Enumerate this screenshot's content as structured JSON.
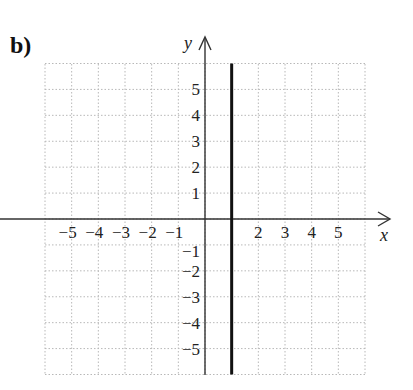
{
  "panel_label": "b)",
  "chart_data": {
    "type": "line",
    "title": "",
    "xlabel": "x",
    "ylabel": "y",
    "xlim": [
      -6,
      6
    ],
    "ylim": [
      -6,
      6
    ],
    "grid": true,
    "grid_style": "dotted",
    "x_ticks": [
      "-5",
      "-4",
      "-3",
      "-2",
      "-1",
      "2",
      "3",
      "4",
      "5"
    ],
    "y_ticks": [
      "5",
      "4",
      "3",
      "2",
      "1",
      "-1",
      "-2",
      "-3",
      "-4",
      "-5"
    ],
    "series": [
      {
        "name": "x = 1",
        "type": "vertical_line",
        "x": 1,
        "y_range": [
          -6,
          6
        ],
        "color": "#111111"
      }
    ]
  },
  "colors": {
    "axis": "#333333",
    "grid": "#b8b8b8",
    "line": "#111111"
  }
}
